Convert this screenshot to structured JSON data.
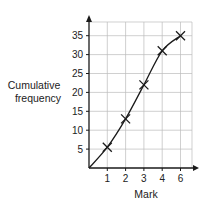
{
  "chart_data": {
    "type": "line",
    "title": "",
    "xlabel": "Mark",
    "ylabel": "Cumulative frequency",
    "x_tick_labels": [
      "1",
      "2",
      "3",
      "4",
      "6"
    ],
    "y_tick_labels": [
      "5",
      "10",
      "15",
      "20",
      "25",
      "30",
      "35"
    ],
    "x": [
      0,
      1,
      2,
      3,
      4,
      5
    ],
    "x_display": [
      "",
      "1",
      "2",
      "3",
      "4",
      "6"
    ],
    "series": [
      {
        "name": "Cumulative frequency",
        "values": [
          0,
          5.5,
          13,
          22,
          31,
          35
        ],
        "marker": "x",
        "smooth": true
      }
    ],
    "ylim": [
      0,
      38
    ],
    "grid": true,
    "legend": "none"
  },
  "axes": {
    "xlabel": "Mark",
    "ylabel_line1": "Cumulative",
    "ylabel_line2": "frequency"
  },
  "colors": {
    "line": "#1a1a1a",
    "grid": "#bbbbbb",
    "axis": "#1a1a1a"
  }
}
